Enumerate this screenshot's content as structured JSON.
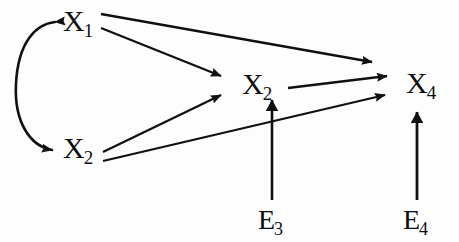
{
  "diagram": {
    "type": "path-diagram",
    "background_color": "#fdfdfd",
    "stroke_color": "#101010",
    "nodes": [
      {
        "id": "X1",
        "base": "X",
        "subscript": "1",
        "label": "X1",
        "x": 80,
        "y": 22
      },
      {
        "id": "X2",
        "base": "X",
        "subscript": "2",
        "label": "X2",
        "x": 80,
        "y": 149
      },
      {
        "id": "X3",
        "base": "X",
        "subscript": "2",
        "label": "X2",
        "x": 259,
        "y": 85
      },
      {
        "id": "X4",
        "base": "X",
        "subscript": "4",
        "label": "X4",
        "x": 423,
        "y": 84
      }
    ],
    "error_terms": [
      {
        "id": "E3",
        "base": "E",
        "subscript": "3",
        "label": "E3",
        "x": 272,
        "y": 221,
        "target": "X3"
      },
      {
        "id": "E4",
        "base": "E",
        "subscript": "4",
        "label": "E4",
        "x": 417,
        "y": 221,
        "target": "X4"
      }
    ],
    "edges": [
      {
        "from": "X1",
        "to": "X4",
        "style": "straight",
        "arrow": "single"
      },
      {
        "from": "X1",
        "to": "X3",
        "style": "straight",
        "arrow": "single"
      },
      {
        "from": "X2",
        "to": "X3",
        "style": "straight",
        "arrow": "single"
      },
      {
        "from": "X2",
        "to": "X4",
        "style": "straight",
        "arrow": "single"
      },
      {
        "from": "X3",
        "to": "X4",
        "style": "straight",
        "arrow": "single"
      },
      {
        "from": "E3",
        "to": "X3",
        "style": "vertical",
        "arrow": "single"
      },
      {
        "from": "E4",
        "to": "X4",
        "style": "vertical",
        "arrow": "single"
      },
      {
        "from": "X1",
        "to": "X2",
        "style": "curved-feedback",
        "arrow": "double",
        "note": "reciprocal loop, arrowheads at both X1 and X2"
      }
    ]
  }
}
